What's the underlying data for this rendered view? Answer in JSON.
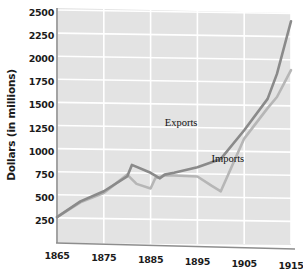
{
  "chart_data": {
    "type": "line",
    "title": "",
    "xlabel": "",
    "ylabel": "Dollars (in millions)",
    "xlim": [
      1865,
      1915
    ],
    "ylim": [
      0,
      2500
    ],
    "grid": true,
    "legend_position": "inline-annotation",
    "x_ticks": [
      "1865",
      "1875",
      "1885",
      "1895",
      "1905",
      "1915"
    ],
    "y_ticks": [
      "250",
      "500",
      "750",
      "1000",
      "1250",
      "1500",
      "1750",
      "2000",
      "2250",
      "2500"
    ],
    "series": [
      {
        "name": "Exports",
        "color": "#8a8a8a",
        "x": [
          1865,
          1870,
          1875,
          1880,
          1881,
          1885,
          1887,
          1888,
          1890,
          1895,
          1900,
          1905,
          1910,
          1912,
          1915
        ],
        "values": [
          280,
          450,
          560,
          720,
          845,
          760,
          700,
          740,
          760,
          820,
          910,
          1220,
          1560,
          1830,
          2400
        ]
      },
      {
        "name": "Imports",
        "color": "#b6b6b6",
        "x": [
          1865,
          1870,
          1875,
          1880,
          1882,
          1885,
          1886,
          1888,
          1890,
          1895,
          1898,
          1900,
          1905,
          1910,
          1912,
          1915
        ],
        "values": [
          280,
          440,
          540,
          740,
          640,
          590,
          700,
          730,
          730,
          720,
          620,
          560,
          1130,
          1460,
          1580,
          1870
        ]
      }
    ],
    "annotations": [
      {
        "text": "Exports",
        "x": 1894,
        "y": 1290
      },
      {
        "text": "Imports",
        "x": 1904,
        "y": 900
      }
    ]
  },
  "style": {
    "plot_background": "#e3e3e3",
    "gridline_color": "#ffffff",
    "axis_color": "#8d8d8d",
    "text_color": "#1b1b1b",
    "page_background": "#ffffff"
  }
}
